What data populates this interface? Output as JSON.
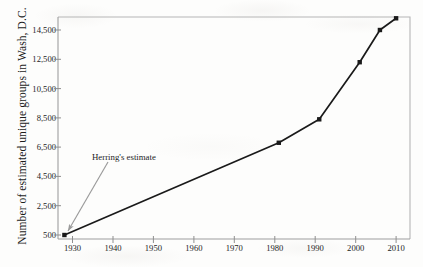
{
  "chart_data": {
    "type": "line",
    "title": "",
    "xlabel": "",
    "ylabel": "Number of estimated unique groups in Wash, D.C.",
    "xlim": [
      1925,
      2012
    ],
    "ylim": [
      500,
      15800
    ],
    "grid": false,
    "legend": "none",
    "x_ticks": [
      "1930",
      "1940",
      "1950",
      "1960",
      "1970",
      "1980",
      "1990",
      "2000",
      "2010"
    ],
    "x_tick_values": [
      1930,
      1940,
      1950,
      1960,
      1970,
      1980,
      1990,
      2000,
      2010
    ],
    "y_ticks": [
      "500",
      "2,500",
      "4,500",
      "6,500",
      "8,500",
      "10,500",
      "12,500",
      "14,500"
    ],
    "y_tick_values": [
      500,
      2500,
      4500,
      6500,
      8500,
      10500,
      12500,
      14500
    ],
    "series": [
      {
        "name": "Estimated unique groups",
        "x": [
          1928,
          1981,
          1991,
          2001,
          2006,
          2010
        ],
        "values": [
          500,
          6800,
          8400,
          12300,
          14500,
          15300
        ],
        "color": "#1a1a1a",
        "marker": "square"
      }
    ],
    "annotations": [
      {
        "text": "Herring's estimate",
        "target_x": 1928,
        "target_y": 500,
        "color": "#9a9a9a"
      }
    ]
  },
  "figure": {
    "frame_color": "#b6b6b6",
    "line_color": "#1a1a1a",
    "annotation_color": "#9a9a9a",
    "background": "#fdfdfc"
  }
}
